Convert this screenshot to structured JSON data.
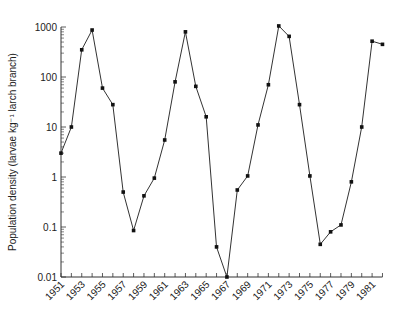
{
  "chart_data": {
    "type": "line",
    "title": "",
    "xlabel": "",
    "ylabel": "Population density (larvae kg⁻¹ larch branch)",
    "yscale": "log",
    "ylim": [
      0.01,
      1000
    ],
    "xlim": [
      1951,
      1982
    ],
    "grid": false,
    "legend": null,
    "y_ticks": [
      "0.01",
      "0.1",
      "1",
      "10",
      "100",
      "1000"
    ],
    "x_ticks": [
      "1951",
      "1953",
      "1955",
      "1957",
      "1959",
      "1961",
      "1963",
      "1965",
      "1967",
      "1969",
      "1971",
      "1973",
      "1975",
      "1977",
      "1979",
      "1981"
    ],
    "x": [
      1951,
      1952,
      1953,
      1954,
      1955,
      1956,
      1957,
      1958,
      1959,
      1960,
      1961,
      1962,
      1963,
      1964,
      1965,
      1966,
      1967,
      1968,
      1969,
      1970,
      1971,
      1972,
      1973,
      1974,
      1975,
      1976,
      1977,
      1978,
      1979,
      1980,
      1981,
      1982
    ],
    "series": [
      {
        "name": "Larch budmoth density",
        "values": [
          3,
          10,
          350,
          870,
          60,
          28,
          0.5,
          0.085,
          0.42,
          0.95,
          5.5,
          80,
          800,
          65,
          16,
          0.04,
          0.01,
          0.55,
          1.05,
          11,
          70,
          1050,
          650,
          28,
          1.05,
          0.045,
          0.08,
          0.11,
          0.8,
          10,
          520,
          450
        ]
      }
    ]
  }
}
